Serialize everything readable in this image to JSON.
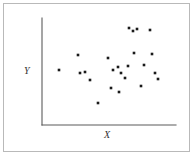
{
  "figure": {
    "title": "",
    "frame_color": "#b9b9b9",
    "background_color": "#ffffff"
  },
  "axes": {
    "x_label": "X",
    "y_label": "Y",
    "axis_color": "#5b5b5b",
    "x_axis_pixel": {
      "x1": 42,
      "y1": 125,
      "x2": 176,
      "y2": 125
    },
    "y_axis_pixel": {
      "x1": 42,
      "y1": 18,
      "x2": 42,
      "y2": 125
    }
  },
  "marker": {
    "shape": "square",
    "color": "#1a1a1a",
    "size_px": 2.6
  },
  "chart_data": {
    "type": "scatter",
    "title": "",
    "xlabel": "X",
    "ylabel": "Y",
    "xlim": [
      0,
      100
    ],
    "ylim": [
      0,
      100
    ],
    "grid": false,
    "legend": "none",
    "axis_ticks": "none",
    "n_points": 24,
    "series": [
      {
        "name": "observations",
        "marker": "square",
        "color": "#1a1a1a",
        "points_pixel": [
          [
            59,
            70
          ],
          [
            78,
            55
          ],
          [
            80,
            73
          ],
          [
            85,
            72
          ],
          [
            90,
            80
          ],
          [
            98,
            103
          ],
          [
            108,
            58
          ],
          [
            111,
            88
          ],
          [
            113,
            70
          ],
          [
            118,
            67
          ],
          [
            119,
            92
          ],
          [
            121,
            73
          ],
          [
            125,
            78
          ],
          [
            129,
            28
          ],
          [
            133,
            31
          ],
          [
            137,
            29
          ],
          [
            128,
            66
          ],
          [
            134,
            53
          ],
          [
            141,
            86
          ],
          [
            144,
            65
          ],
          [
            150,
            30
          ],
          [
            152,
            54
          ],
          [
            155,
            73
          ],
          [
            158,
            79
          ]
        ],
        "x": [
          13,
          27,
          28,
          32,
          36,
          42,
          49,
          51,
          53,
          57,
          57,
          59,
          62,
          65,
          68,
          71,
          64,
          69,
          74,
          76,
          81,
          82,
          84,
          87
        ],
        "y": [
          51,
          65,
          49,
          50,
          42,
          21,
          63,
          35,
          51,
          54,
          31,
          49,
          44,
          91,
          88,
          90,
          55,
          67,
          36,
          56,
          89,
          66,
          49,
          43
        ]
      }
    ]
  }
}
